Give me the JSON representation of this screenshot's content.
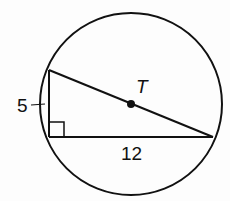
{
  "diagram": {
    "circle_center_label": "T",
    "leg_short_label": "5",
    "leg_long_label": "12",
    "colors": {
      "stroke": "#111111",
      "background": "#fdfdfd"
    }
  }
}
